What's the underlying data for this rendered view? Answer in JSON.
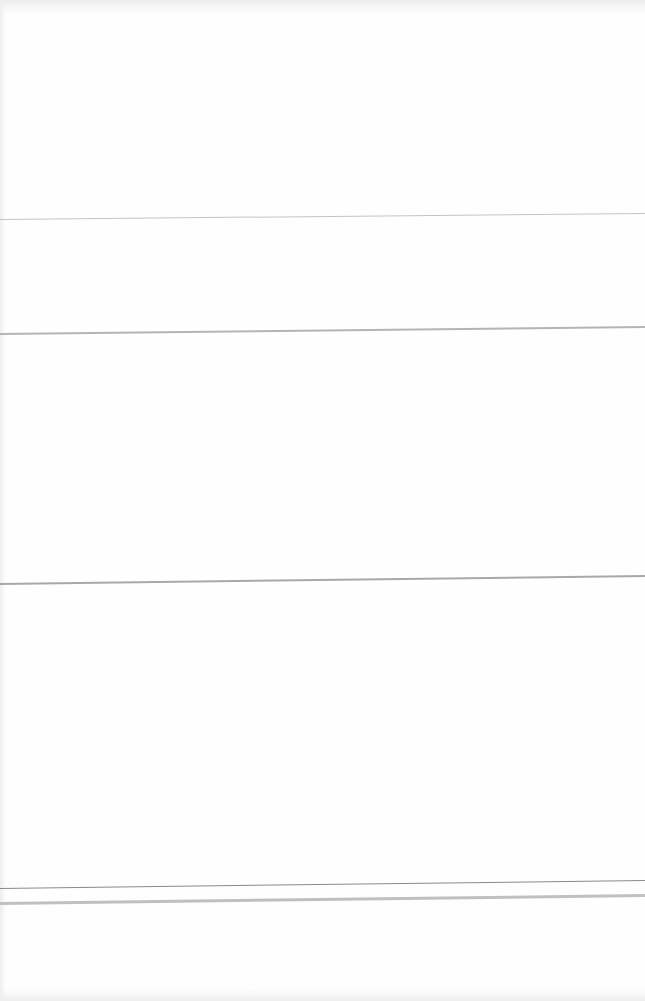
{
  "document": {
    "type": "blank ruled page",
    "background_color": "#fefefe",
    "rules": [
      {
        "y_left": 219,
        "y_right": 213,
        "thickness": 1,
        "color": "#c4c4c4"
      },
      {
        "y_left": 334,
        "y_right": 327,
        "thickness": 2,
        "color": "#b4b4b4"
      },
      {
        "y_left": 584,
        "y_right": 576,
        "thickness": 2,
        "color": "#a8a8a8"
      },
      {
        "y_left": 888,
        "y_right": 880,
        "thickness": 1,
        "color": "#8a8a8a"
      },
      {
        "y_left": 903,
        "y_right": 895,
        "thickness": 3,
        "color": "#c0c0c0"
      }
    ]
  }
}
